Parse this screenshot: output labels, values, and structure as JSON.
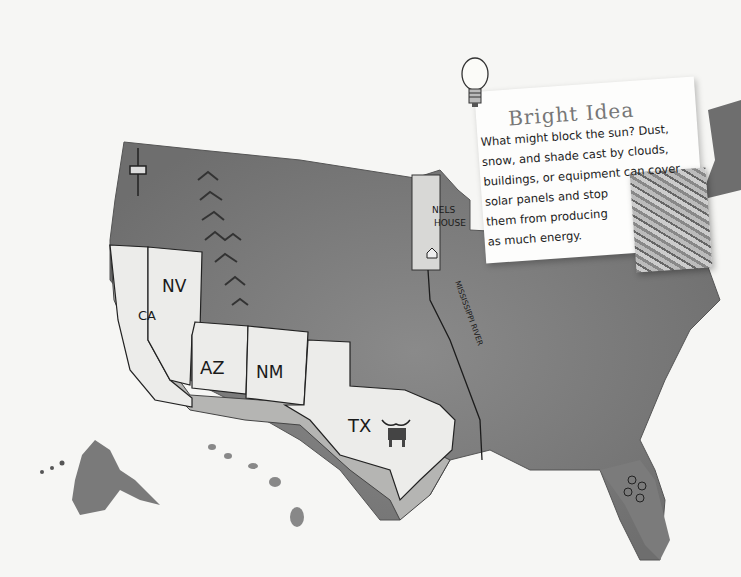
{
  "map": {
    "title": "United States illustrated watercolor map",
    "state_labels": [
      {
        "id": "ca",
        "label": "CA"
      },
      {
        "id": "nv",
        "label": "NV"
      },
      {
        "id": "az",
        "label": "AZ"
      },
      {
        "id": "nm",
        "label": "NM"
      },
      {
        "id": "tx",
        "label": "TX"
      }
    ],
    "place_labels": {
      "nels_house_line1": "NELS",
      "nels_house_line2": "HOUSE",
      "river": "MISSISSIPPI RIVER"
    },
    "icons": [
      "space-needle-icon",
      "mountains-icon",
      "house-icon",
      "longhorn-icon",
      "flowers-icon",
      "lightbulb-icon"
    ],
    "colors": {
      "land": "#7d7d7d",
      "highlighted_states": "#ececea",
      "coast": "#b5b5b3",
      "background": "#f6f6f4"
    }
  },
  "callout": {
    "title": "Bright Idea",
    "body_lines": [
      "What might block the sun? Dust,",
      "snow, and shade cast by clouds,",
      "buildings, or equipment can cover",
      "solar panels and stop",
      "them from producing",
      "as much energy."
    ]
  }
}
